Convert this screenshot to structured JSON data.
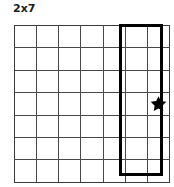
{
  "puzzle": {
    "title": "2x7",
    "grid": {
      "columns": 7,
      "rows": 7,
      "line_color": "#494949",
      "background_color": "#ffffff"
    },
    "highlight": {
      "label": "2x7",
      "span_columns": 2,
      "span_rows": 7,
      "start_column": 6,
      "end_column": 7,
      "start_row": 1,
      "end_row": 7,
      "border_color": "#000000",
      "border_width_px": 3
    },
    "marker": {
      "icon": "star-icon",
      "color": "#000000",
      "row": 4,
      "column": 7
    },
    "cells": [
      [
        "",
        "",
        "",
        "",
        "",
        "",
        ""
      ],
      [
        "",
        "",
        "",
        "",
        "",
        "",
        ""
      ],
      [
        "",
        "",
        "",
        "",
        "",
        "",
        ""
      ],
      [
        "",
        "",
        "",
        "",
        "",
        "",
        "star"
      ],
      [
        "",
        "",
        "",
        "",
        "",
        "",
        ""
      ],
      [
        "",
        "",
        "",
        "",
        "",
        "",
        ""
      ],
      [
        "",
        "",
        "",
        "",
        "",
        "",
        ""
      ]
    ]
  }
}
